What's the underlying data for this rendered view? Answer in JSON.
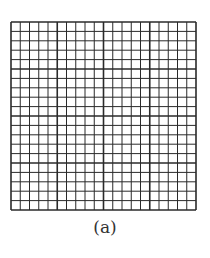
{
  "figure": {
    "caption": "(a)",
    "grid": {
      "rows": 20,
      "cols": 20,
      "major_every": 5,
      "width": 185,
      "height": 188,
      "line_color": "#2a2a2a",
      "minor_width": 1,
      "major_width": 1.6,
      "border_width": 1.6
    }
  }
}
